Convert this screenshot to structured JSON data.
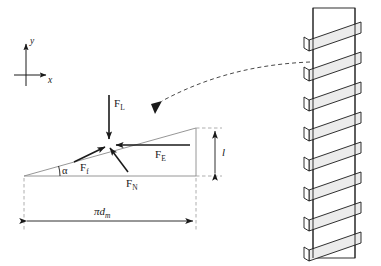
{
  "diagram": {
    "axes": {
      "x_label": "x",
      "y_label": "y",
      "x_icon": "arrow-right-icon",
      "y_icon": "arrow-up-icon"
    },
    "forces": [
      {
        "id": "load",
        "symbol": "F",
        "subscript": "L",
        "label": "F_L",
        "direction": "down",
        "description": "Load force acting vertically downward"
      },
      {
        "id": "friction",
        "symbol": "F",
        "subscript": "f",
        "label": "F_f",
        "direction": "up-incline",
        "description": "Friction force along the inclined plane"
      },
      {
        "id": "effort",
        "symbol": "F",
        "subscript": "E",
        "label": "F_E",
        "direction": "left",
        "description": "Effort force applied horizontally"
      },
      {
        "id": "normal",
        "symbol": "F",
        "subscript": "N",
        "label": "F_N",
        "direction": "normal",
        "description": "Normal force perpendicular to the incline"
      }
    ],
    "angle": {
      "label": "α",
      "name": "helix-angle"
    },
    "dimensions": [
      {
        "id": "lead",
        "label": "l",
        "orientation": "vertical",
        "name": "lead-dimension"
      },
      {
        "id": "circumference",
        "label": "πd",
        "sublabel": "m",
        "orientation": "horizontal",
        "name": "circumference-dimension"
      }
    ],
    "screw": {
      "name": "helical-screw-thread",
      "thread_count": 8,
      "fill_color": "#ececec",
      "stroke_color": "#1a1a1a"
    },
    "leader": {
      "name": "dashed-leader-curve",
      "style": "dashed",
      "arrow": "arrow-down-left"
    },
    "colors": {
      "ink": "#1a1a1a",
      "thin_line": "#7a7a7a",
      "dashed_line": "#9a9a9a",
      "background": "#ffffff",
      "thread_fill": "#ececec"
    }
  }
}
